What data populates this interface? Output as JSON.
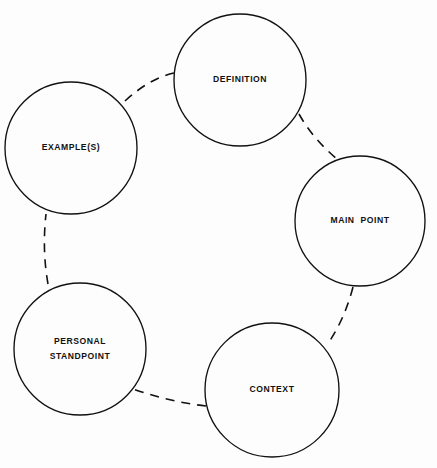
{
  "diagram": {
    "type": "cycle-diagram",
    "title": "",
    "background_color": "#fdfdfd",
    "stroke_color": "#111111",
    "canvas": {
      "width": 437,
      "height": 468
    },
    "nodes": [
      {
        "id": "definition",
        "label": "DEFINITION",
        "label_lines": [
          "DEFINITION"
        ],
        "cx": 240,
        "cy": 80,
        "r": 66,
        "icon": "circle-node-icon"
      },
      {
        "id": "main-point",
        "label": "MAIN POINT",
        "label_lines": [
          "MAIN  POINT"
        ],
        "cx": 360,
        "cy": 221,
        "r": 65,
        "icon": "circle-node-icon"
      },
      {
        "id": "context",
        "label": "CONTEXT",
        "label_lines": [
          "CONTEXT"
        ],
        "cx": 272,
        "cy": 390,
        "r": 67,
        "icon": "circle-node-icon"
      },
      {
        "id": "personal-standpoint",
        "label": "PERSONAL STANDPOINT",
        "label_lines": [
          "PERSONAL",
          "STANDPOINT"
        ],
        "cx": 80,
        "cy": 349,
        "r": 66,
        "icon": "circle-node-icon"
      },
      {
        "id": "examples",
        "label": "EXAMPLE(S)",
        "label_lines": [
          "EXAMPLE(S)"
        ],
        "cx": 71,
        "cy": 148,
        "r": 66,
        "icon": "circle-node-icon"
      }
    ],
    "connectors": [
      {
        "id": "examples-to-definition",
        "from": "examples",
        "to": "definition",
        "style": "dashed",
        "path": "M 125,101 Q 150,78 174,73"
      },
      {
        "id": "definition-to-main-point",
        "from": "definition",
        "to": "main-point",
        "style": "dashed",
        "path": "M 299,114 Q 313,139 337,159"
      },
      {
        "id": "main-point-to-context",
        "from": "main-point",
        "to": "context",
        "style": "dashed",
        "path": "M 353,287 Q 345,318 329,342"
      },
      {
        "id": "context-to-personal-standpoint",
        "from": "context",
        "to": "personal-standpoint",
        "style": "dashed",
        "path": "M 206,406 Q 170,402 133,389"
      },
      {
        "id": "personal-standpoint-to-examples",
        "from": "personal-standpoint",
        "to": "examples",
        "style": "dashed",
        "path": "M 48,284 Q 42,250 46,214"
      }
    ]
  }
}
